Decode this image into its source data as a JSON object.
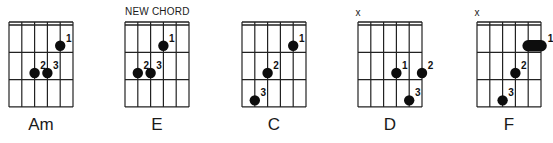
{
  "caption": {
    "text": "NEW CHORD",
    "over_chord_index": 1
  },
  "grid": {
    "strings": 6,
    "frets": 3,
    "string_spacing": 12.8,
    "fret_spacing": 27.3,
    "nut_top": 22,
    "nut_bottom": 25,
    "line_color": "#222222",
    "dot_color": "#0d0d0d",
    "dot_radius": 5.2
  },
  "chords": [
    {
      "name": "Am",
      "x0": 9,
      "muted": [],
      "fingers": [
        {
          "finger": "1",
          "string": 4,
          "fret": 1
        },
        {
          "finger": "2",
          "string": 2,
          "fret": 2
        },
        {
          "finger": "3",
          "string": 3,
          "fret": 2
        }
      ]
    },
    {
      "name": "E",
      "x0": 125,
      "muted": [],
      "fingers": [
        {
          "finger": "1",
          "string": 3,
          "fret": 1
        },
        {
          "finger": "2",
          "string": 1,
          "fret": 2
        },
        {
          "finger": "3",
          "string": 2,
          "fret": 2
        }
      ]
    },
    {
      "name": "C",
      "x0": 242,
      "muted": [],
      "fingers": [
        {
          "finger": "1",
          "string": 4,
          "fret": 1
        },
        {
          "finger": "2",
          "string": 2,
          "fret": 2
        },
        {
          "finger": "3",
          "string": 1,
          "fret": 3
        }
      ]
    },
    {
      "name": "D",
      "x0": 358,
      "muted": [
        0
      ],
      "fingers": [
        {
          "finger": "1",
          "string": 3,
          "fret": 2
        },
        {
          "finger": "2",
          "string": 5,
          "fret": 2
        },
        {
          "finger": "3",
          "string": 4,
          "fret": 3
        }
      ]
    },
    {
      "name": "F",
      "x0": 477,
      "muted": [
        0
      ],
      "fingers": [
        {
          "finger": "1",
          "string": 4,
          "string_end": 5,
          "fret": 1,
          "barre": true
        },
        {
          "finger": "2",
          "string": 3,
          "fret": 2
        },
        {
          "finger": "3",
          "string": 2,
          "fret": 3
        }
      ]
    }
  ],
  "muted_symbol": "x"
}
